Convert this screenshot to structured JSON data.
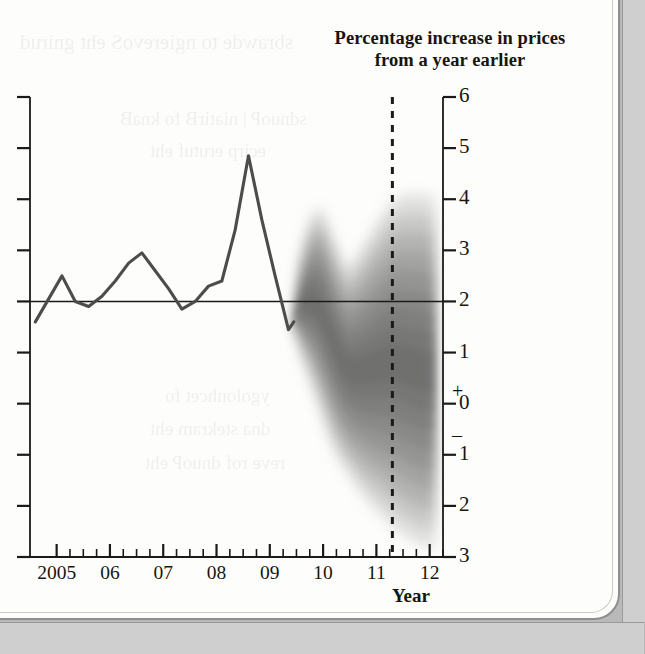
{
  "page": {
    "background_color": "#fdfdfb",
    "gutter_color": "#cfcfcf"
  },
  "showthrough": [
    {
      "text": "sbrawde to ngierevoS eht gnirud",
      "x": 20,
      "y": 30,
      "size": 21
    },
    {
      "text": "sdnuoP | niatirB fo knaB",
      "x": 120,
      "y": 108,
      "size": 19
    },
    {
      "text": "ecirp erutuf eht",
      "x": 150,
      "y": 140,
      "size": 19
    },
    {
      "text": "ygolonhcet fo",
      "x": 165,
      "y": 385,
      "size": 19
    },
    {
      "text": "dna stekram eht",
      "x": 150,
      "y": 418,
      "size": 19
    },
    {
      "text": "reve rof dnuoP eht",
      "x": 145,
      "y": 452,
      "size": 19
    }
  ],
  "chart_data": {
    "type": "line",
    "title": "Percentage increase in prices from a year earlier",
    "title_line1": "Percentage increase in prices",
    "title_line2": "from a year earlier",
    "xlabel": "Year",
    "ylabel": "",
    "ylim": [
      -3,
      6
    ],
    "xlim": [
      2004.5,
      2012.25
    ],
    "grid": false,
    "legend": false,
    "y_ticks": [
      6,
      5,
      4,
      3,
      2,
      1,
      0,
      -1,
      -2,
      -3
    ],
    "y_tick_labels": [
      "6",
      "5",
      "4",
      "3",
      "2",
      "1",
      "0",
      "1",
      "2",
      "3"
    ],
    "y_sign_plus": "+",
    "y_sign_minus": "–",
    "x_ticks": [
      2005,
      2006,
      2007,
      2008,
      2009,
      2010,
      2011,
      2012
    ],
    "x_tick_labels": [
      "2005",
      "06",
      "07",
      "08",
      "09",
      "10",
      "11",
      "12"
    ],
    "x_minor_ticks_per_year": 4,
    "target_line_value": 2.0,
    "forecast_start_x": 2009.45,
    "vertical_dashed_line_x": 2011.3,
    "series": [
      {
        "name": "CPI inflation (history)",
        "type": "line",
        "color": "#4a4a4a",
        "x": [
          2004.6,
          2004.85,
          2005.1,
          2005.35,
          2005.6,
          2005.85,
          2006.1,
          2006.35,
          2006.6,
          2006.85,
          2007.1,
          2007.35,
          2007.6,
          2007.85,
          2008.1,
          2008.35,
          2008.6,
          2008.85,
          2009.1,
          2009.35,
          2009.45
        ],
        "values": [
          1.6,
          2.05,
          2.5,
          2.0,
          1.9,
          2.1,
          2.4,
          2.75,
          2.95,
          2.6,
          2.25,
          1.85,
          2.0,
          2.3,
          2.4,
          3.4,
          4.85,
          3.6,
          2.5,
          1.45,
          1.6
        ]
      },
      {
        "name": "Fan chart projection upper edge (90%)",
        "type": "band-edge",
        "x": [
          2009.45,
          2009.6,
          2009.9,
          2010.2,
          2010.45,
          2010.75,
          2011.05,
          2011.35,
          2011.7,
          2012.1
        ],
        "values": [
          1.75,
          3.0,
          3.85,
          3.25,
          2.7,
          3.1,
          3.6,
          4.0,
          4.1,
          4.05
        ]
      },
      {
        "name": "Fan chart projection lower edge (90%)",
        "type": "band-edge",
        "x": [
          2009.45,
          2009.6,
          2009.9,
          2010.2,
          2010.45,
          2010.75,
          2011.05,
          2011.35,
          2011.7,
          2012.1
        ],
        "values": [
          1.45,
          0.9,
          0.0,
          -0.9,
          -1.35,
          -1.8,
          -2.15,
          -2.45,
          -2.7,
          -2.85
        ]
      },
      {
        "name": "Fan chart central projection",
        "type": "band-center",
        "x": [
          2009.45,
          2009.6,
          2009.9,
          2010.2,
          2010.45,
          2010.75,
          2011.05,
          2011.35,
          2011.7,
          2012.1
        ],
        "values": [
          1.6,
          1.95,
          1.9,
          1.2,
          0.7,
          0.65,
          0.75,
          0.8,
          0.7,
          0.6
        ]
      }
    ],
    "fan_shading": {
      "style": "continuous gradient, darkest at centre, fading outward",
      "color": "#4d4d4d",
      "bands": 9
    }
  }
}
